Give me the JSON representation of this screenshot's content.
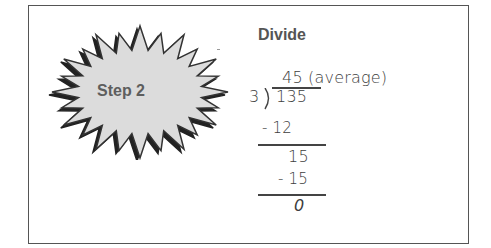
{
  "step": {
    "label": "Step 2",
    "shape_fill": "#dcdcdc",
    "shape_outline": "#333333"
  },
  "operation": {
    "title": "Divide",
    "quotient": "45 (average)",
    "divisor": "3",
    "dividend": "135",
    "steps": [
      {
        "subtract": "- 12",
        "result": "15"
      },
      {
        "subtract": "- 15",
        "result": "0"
      }
    ]
  }
}
